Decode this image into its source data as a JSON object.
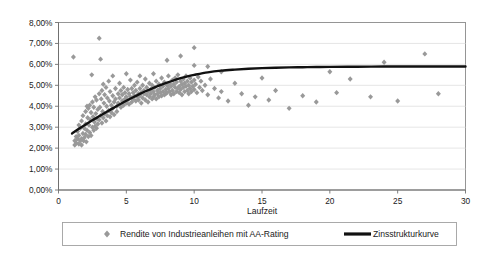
{
  "chart_data": {
    "type": "scatter",
    "title": "",
    "xlabel": "Laufzeit",
    "ylabel": "",
    "xlim": [
      0,
      30
    ],
    "ylim": [
      0,
      0.08
    ],
    "grid": true,
    "legend_position": "bottom",
    "x_ticks": [
      "0",
      "5",
      "10",
      "15",
      "20",
      "25",
      "30"
    ],
    "x_tick_values": [
      0,
      5,
      10,
      15,
      20,
      25,
      30
    ],
    "y_ticks": [
      "0,00%",
      "1,00%",
      "2,00%",
      "3,00%",
      "4,00%",
      "5,00%",
      "6,00%",
      "7,00%",
      "8,00%"
    ],
    "y_tick_values": [
      0,
      1,
      2,
      3,
      4,
      5,
      6,
      7,
      8
    ],
    "series": [
      {
        "name": "Rendite von Industrieanleihen mit AA-Rating",
        "type": "scatter",
        "marker": "diamond",
        "color": "#999999",
        "points": [
          [
            1.1,
            6.35
          ],
          [
            1.2,
            2.35
          ],
          [
            1.2,
            2.15
          ],
          [
            1.3,
            2.55
          ],
          [
            1.3,
            2.25
          ],
          [
            1.4,
            2.45
          ],
          [
            1.4,
            2.8
          ],
          [
            1.5,
            2.2
          ],
          [
            1.5,
            2.6
          ],
          [
            1.5,
            3.1
          ],
          [
            1.6,
            2.35
          ],
          [
            1.6,
            2.95
          ],
          [
            1.7,
            2.45
          ],
          [
            1.7,
            3.3
          ],
          [
            1.7,
            2.15
          ],
          [
            1.8,
            2.7
          ],
          [
            1.8,
            3.55
          ],
          [
            1.85,
            2.35
          ],
          [
            1.9,
            2.95
          ],
          [
            1.9,
            2.5
          ],
          [
            2.0,
            3.75
          ],
          [
            2.0,
            2.65
          ],
          [
            2.0,
            3.15
          ],
          [
            2.05,
            2.3
          ],
          [
            2.1,
            4.0
          ],
          [
            2.1,
            2.85
          ],
          [
            2.15,
            3.45
          ],
          [
            2.2,
            2.55
          ],
          [
            2.2,
            3.9
          ],
          [
            2.25,
            3.1
          ],
          [
            2.3,
            2.75
          ],
          [
            2.3,
            4.05
          ],
          [
            2.35,
            3.35
          ],
          [
            2.4,
            2.6
          ],
          [
            2.4,
            3.7
          ],
          [
            2.45,
            5.5
          ],
          [
            2.5,
            3.0
          ],
          [
            2.5,
            4.2
          ],
          [
            2.55,
            3.5
          ],
          [
            2.6,
            2.85
          ],
          [
            2.6,
            3.95
          ],
          [
            2.65,
            3.25
          ],
          [
            2.7,
            4.45
          ],
          [
            2.7,
            3.05
          ],
          [
            2.75,
            3.65
          ],
          [
            2.8,
            2.95
          ],
          [
            2.8,
            4.3
          ],
          [
            2.85,
            3.4
          ],
          [
            2.9,
            3.85
          ],
          [
            2.9,
            3.15
          ],
          [
            3.0,
            7.25
          ],
          [
            3.0,
            4.6
          ],
          [
            3.0,
            3.35
          ],
          [
            3.05,
            3.95
          ],
          [
            3.1,
            6.25
          ],
          [
            3.1,
            3.55
          ],
          [
            3.15,
            4.35
          ],
          [
            3.2,
            3.2
          ],
          [
            3.2,
            4.75
          ],
          [
            3.25,
            3.75
          ],
          [
            3.3,
            5.05
          ],
          [
            3.3,
            3.45
          ],
          [
            3.35,
            4.15
          ],
          [
            3.4,
            3.65
          ],
          [
            3.4,
            4.55
          ],
          [
            3.5,
            3.3
          ],
          [
            3.5,
            4.9
          ],
          [
            3.55,
            4.0
          ],
          [
            3.6,
            3.55
          ],
          [
            3.6,
            4.4
          ],
          [
            3.7,
            5.2
          ],
          [
            3.7,
            3.8
          ],
          [
            3.75,
            4.25
          ],
          [
            3.8,
            3.5
          ],
          [
            3.8,
            4.7
          ],
          [
            3.9,
            4.05
          ],
          [
            3.9,
            3.7
          ],
          [
            4.0,
            5.45
          ],
          [
            4.0,
            4.5
          ],
          [
            4.0,
            3.9
          ],
          [
            4.1,
            4.2
          ],
          [
            4.1,
            3.6
          ],
          [
            4.2,
            4.85
          ],
          [
            4.2,
            4.35
          ],
          [
            4.3,
            4.0
          ],
          [
            4.3,
            3.75
          ],
          [
            4.4,
            4.6
          ],
          [
            4.4,
            4.15
          ],
          [
            4.5,
            5.1
          ],
          [
            4.5,
            4.4
          ],
          [
            4.6,
            3.95
          ],
          [
            4.6,
            4.75
          ],
          [
            4.7,
            4.25
          ],
          [
            4.7,
            4.55
          ],
          [
            4.8,
            4.05
          ],
          [
            4.8,
            4.9
          ],
          [
            4.9,
            4.35
          ],
          [
            4.9,
            4.65
          ],
          [
            5.0,
            5.55
          ],
          [
            5.0,
            4.15
          ],
          [
            5.0,
            4.45
          ],
          [
            5.1,
            4.8
          ],
          [
            5.1,
            4.3
          ],
          [
            5.2,
            4.6
          ],
          [
            5.2,
            4.1
          ],
          [
            5.3,
            5.25
          ],
          [
            5.3,
            4.45
          ],
          [
            5.4,
            4.85
          ],
          [
            5.4,
            4.2
          ],
          [
            5.5,
            4.65
          ],
          [
            5.5,
            4.35
          ],
          [
            5.6,
            5.0
          ],
          [
            5.6,
            4.5
          ],
          [
            5.7,
            4.25
          ],
          [
            5.7,
            4.75
          ],
          [
            5.8,
            4.45
          ],
          [
            5.8,
            5.15
          ],
          [
            5.9,
            4.6
          ],
          [
            5.9,
            4.3
          ],
          [
            6.0,
            5.45
          ],
          [
            6.0,
            4.85
          ],
          [
            6.0,
            4.5
          ],
          [
            6.1,
            4.65
          ],
          [
            6.1,
            4.15
          ],
          [
            6.2,
            5.0
          ],
          [
            6.2,
            4.4
          ],
          [
            6.3,
            4.75
          ],
          [
            6.3,
            4.6
          ],
          [
            6.4,
            5.3
          ],
          [
            6.4,
            4.3
          ],
          [
            6.5,
            4.9
          ],
          [
            6.5,
            4.55
          ],
          [
            6.6,
            4.7
          ],
          [
            6.6,
            4.2
          ],
          [
            6.7,
            5.1
          ],
          [
            6.7,
            4.45
          ],
          [
            6.8,
            4.8
          ],
          [
            6.8,
            4.6
          ],
          [
            6.9,
            4.35
          ],
          [
            6.9,
            5.0
          ],
          [
            7.0,
            5.55
          ],
          [
            7.0,
            4.7
          ],
          [
            7.0,
            4.45
          ],
          [
            7.1,
            4.9
          ],
          [
            7.1,
            4.55
          ],
          [
            7.2,
            5.2
          ],
          [
            7.2,
            4.35
          ],
          [
            7.3,
            4.75
          ],
          [
            7.3,
            4.6
          ],
          [
            7.4,
            5.05
          ],
          [
            7.4,
            4.45
          ],
          [
            7.5,
            4.85
          ],
          [
            7.5,
            4.65
          ],
          [
            7.6,
            5.35
          ],
          [
            7.6,
            4.5
          ],
          [
            7.7,
            4.95
          ],
          [
            7.7,
            4.7
          ],
          [
            7.8,
            4.55
          ],
          [
            7.8,
            5.15
          ],
          [
            7.9,
            4.8
          ],
          [
            7.9,
            4.6
          ],
          [
            8.0,
            6.2
          ],
          [
            8.0,
            5.0
          ],
          [
            8.0,
            4.65
          ],
          [
            8.1,
            4.85
          ],
          [
            8.1,
            5.45
          ],
          [
            8.2,
            4.7
          ],
          [
            8.2,
            5.1
          ],
          [
            8.3,
            4.55
          ],
          [
            8.3,
            4.95
          ],
          [
            8.4,
            5.25
          ],
          [
            8.4,
            4.75
          ],
          [
            8.5,
            5.05
          ],
          [
            8.5,
            4.6
          ],
          [
            8.6,
            4.9
          ],
          [
            8.6,
            5.35
          ],
          [
            8.7,
            4.7
          ],
          [
            8.7,
            5.15
          ],
          [
            8.8,
            4.85
          ],
          [
            8.8,
            5.5
          ],
          [
            8.9,
            4.95
          ],
          [
            8.9,
            4.65
          ],
          [
            9.0,
            6.4
          ],
          [
            9.0,
            5.2
          ],
          [
            9.0,
            4.8
          ],
          [
            9.1,
            5.05
          ],
          [
            9.1,
            4.55
          ],
          [
            9.2,
            5.3
          ],
          [
            9.2,
            4.9
          ],
          [
            9.3,
            5.1
          ],
          [
            9.3,
            4.7
          ],
          [
            9.4,
            5.45
          ],
          [
            9.4,
            4.95
          ],
          [
            9.5,
            5.2
          ],
          [
            9.5,
            4.75
          ],
          [
            9.6,
            5.0
          ],
          [
            9.6,
            4.6
          ],
          [
            9.7,
            5.35
          ],
          [
            9.7,
            4.85
          ],
          [
            9.8,
            5.15
          ],
          [
            9.8,
            4.7
          ],
          [
            9.9,
            4.95
          ],
          [
            10.0,
            6.8
          ],
          [
            10.0,
            5.95
          ],
          [
            10.0,
            5.25
          ],
          [
            10.0,
            4.8
          ],
          [
            10.1,
            5.05
          ],
          [
            10.2,
            4.65
          ],
          [
            10.3,
            5.4
          ],
          [
            10.4,
            4.9
          ],
          [
            10.5,
            5.2
          ],
          [
            10.6,
            4.75
          ],
          [
            10.8,
            5.0
          ],
          [
            11.0,
            5.9
          ],
          [
            11.0,
            4.55
          ],
          [
            11.2,
            5.3
          ],
          [
            11.5,
            4.85
          ],
          [
            11.8,
            4.4
          ],
          [
            12.0,
            5.65
          ],
          [
            12.0,
            4.7
          ],
          [
            12.5,
            4.25
          ],
          [
            13.0,
            5.1
          ],
          [
            13.5,
            4.6
          ],
          [
            14.0,
            4.05
          ],
          [
            14.5,
            4.45
          ],
          [
            15.0,
            5.35
          ],
          [
            15.5,
            4.3
          ],
          [
            16.0,
            4.75
          ],
          [
            17.0,
            3.9
          ],
          [
            18.0,
            4.5
          ],
          [
            19.0,
            4.2
          ],
          [
            20.0,
            5.65
          ],
          [
            20.5,
            4.65
          ],
          [
            21.5,
            5.3
          ],
          [
            23.0,
            4.45
          ],
          [
            24.0,
            6.1
          ],
          [
            25.0,
            4.25
          ],
          [
            27.0,
            6.5
          ],
          [
            28.0,
            4.6
          ]
        ]
      },
      {
        "name": "Zinsstrukturkurve",
        "type": "line",
        "color": "#111111",
        "points": [
          [
            1.0,
            2.7
          ],
          [
            1.5,
            2.92
          ],
          [
            2.0,
            3.13
          ],
          [
            2.5,
            3.33
          ],
          [
            3.0,
            3.52
          ],
          [
            3.5,
            3.71
          ],
          [
            4.0,
            3.9
          ],
          [
            4.5,
            4.08
          ],
          [
            5.0,
            4.26
          ],
          [
            5.5,
            4.43
          ],
          [
            6.0,
            4.59
          ],
          [
            6.5,
            4.74
          ],
          [
            7.0,
            4.88
          ],
          [
            7.5,
            5.01
          ],
          [
            8.0,
            5.13
          ],
          [
            8.5,
            5.24
          ],
          [
            9.0,
            5.34
          ],
          [
            9.5,
            5.43
          ],
          [
            10.0,
            5.5
          ],
          [
            11.0,
            5.62
          ],
          [
            12.0,
            5.7
          ],
          [
            13.0,
            5.75
          ],
          [
            14.0,
            5.79
          ],
          [
            15.0,
            5.82
          ],
          [
            16.0,
            5.84
          ],
          [
            17.0,
            5.855
          ],
          [
            18.0,
            5.865
          ],
          [
            19.0,
            5.875
          ],
          [
            20.0,
            5.882
          ],
          [
            22.0,
            5.89
          ],
          [
            24.0,
            5.895
          ],
          [
            26.0,
            5.9
          ],
          [
            28.0,
            5.9
          ],
          [
            30.0,
            5.9
          ]
        ]
      }
    ],
    "legend": [
      {
        "label": "Rendite von Industrieanleihen mit AA-Rating",
        "marker": "diamond",
        "color": "#999999"
      },
      {
        "label": "Zinsstrukturkurve",
        "marker": "line",
        "color": "#111111"
      }
    ]
  }
}
